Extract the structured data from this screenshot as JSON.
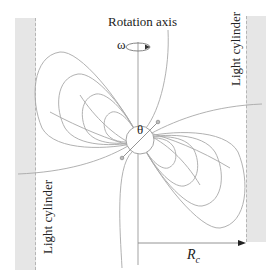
{
  "figure": {
    "labels": {
      "rotation_axis": "Rotation axis",
      "omega": "ω",
      "theta": "θ",
      "light_cylinder_left": "Light cylinder",
      "light_cylinder_right": "Light cylinder",
      "rc_symbol": "R",
      "rc_subscript": "c"
    },
    "colors": {
      "field_lines": "#a8a8a8",
      "light_cylinder_fill": "#e6e6e6",
      "text": "#222222",
      "axis": "#888888"
    }
  }
}
